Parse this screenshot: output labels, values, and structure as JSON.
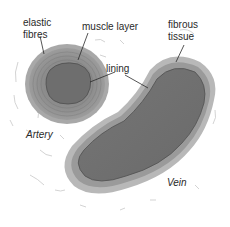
{
  "diagram": {
    "labels": {
      "elastic_fibres_line1": "elastic",
      "elastic_fibres_line2": "fibres",
      "muscle_layer": "muscle layer",
      "fibrous_tissue_line1": "fibrous",
      "fibrous_tissue_line2": "tissue",
      "lining": "lining",
      "artery": "Artery",
      "vein": "Vein"
    },
    "colors": {
      "background": "#ffffff",
      "lumen": "#6e6e6e",
      "artery_wall": "#8c8c8c",
      "artery_wall_light": "#a8a8a8",
      "vein_wall_outer": "#b5b5b5",
      "vein_wall_inner": "#8f8f8f",
      "leader_line": "#2a2a2a",
      "text": "#2a2a2a"
    }
  }
}
